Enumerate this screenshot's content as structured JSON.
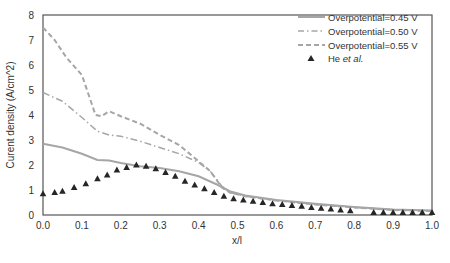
{
  "chart_data": {
    "type": "line",
    "title": "",
    "xlabel": "x/l",
    "ylabel": "Curent density (A/cm^2)",
    "xlim": [
      0.0,
      1.0
    ],
    "ylim": [
      0,
      8
    ],
    "xticks": [
      "0.0",
      "0.1",
      "0.2",
      "0.3",
      "0.4",
      "0.5",
      "0.6",
      "0.7",
      "0.8",
      "0.9",
      "1.0"
    ],
    "yticks": [
      "0",
      "1",
      "2",
      "3",
      "4",
      "5",
      "6",
      "7",
      "8"
    ],
    "grid": false,
    "legend_position": "upper right",
    "series": [
      {
        "name": "Overpotential=0.45 V",
        "style": "solid",
        "color": "#a6a6a6",
        "x": [
          0.0,
          0.05,
          0.1,
          0.14,
          0.17,
          0.2,
          0.25,
          0.3,
          0.35,
          0.4,
          0.45,
          0.48,
          0.52,
          0.6,
          0.7,
          0.8,
          0.9,
          1.0
        ],
        "y": [
          2.85,
          2.7,
          2.45,
          2.2,
          2.18,
          2.08,
          1.95,
          1.88,
          1.75,
          1.55,
          1.2,
          0.95,
          0.78,
          0.6,
          0.45,
          0.32,
          0.22,
          0.18
        ]
      },
      {
        "name": "Overpotential=0.50 V",
        "style": "dashdot",
        "color": "#a6a6a6",
        "x": [
          0.0,
          0.05,
          0.1,
          0.14,
          0.17,
          0.2,
          0.25,
          0.3,
          0.35,
          0.4,
          0.43,
          0.46,
          0.48,
          0.52,
          0.6,
          0.7,
          0.8,
          0.9,
          1.0
        ],
        "y": [
          4.9,
          4.55,
          3.9,
          3.35,
          3.2,
          3.15,
          2.95,
          2.7,
          2.45,
          2.1,
          1.75,
          1.15,
          0.9,
          0.75,
          0.58,
          0.42,
          0.3,
          0.2,
          0.16
        ]
      },
      {
        "name": "Overpotential=0.55 V",
        "style": "dashed",
        "color": "#a6a6a6",
        "x": [
          0.0,
          0.03,
          0.06,
          0.1,
          0.135,
          0.15,
          0.17,
          0.2,
          0.25,
          0.3,
          0.35,
          0.4,
          0.43,
          0.46,
          0.48,
          0.52,
          0.6,
          0.7,
          0.8,
          0.9,
          1.0
        ],
        "y": [
          7.5,
          7.0,
          6.3,
          5.6,
          4.0,
          3.95,
          4.15,
          3.95,
          3.65,
          3.2,
          2.8,
          2.15,
          1.75,
          1.1,
          0.9,
          0.75,
          0.58,
          0.42,
          0.3,
          0.2,
          0.16
        ]
      },
      {
        "name": "He et al.",
        "style": "marker-triangle",
        "color": "#262626",
        "x": [
          0.0,
          0.03,
          0.05,
          0.08,
          0.11,
          0.14,
          0.165,
          0.19,
          0.215,
          0.24,
          0.265,
          0.29,
          0.315,
          0.34,
          0.365,
          0.39,
          0.415,
          0.44,
          0.465,
          0.49,
          0.515,
          0.54,
          0.565,
          0.59,
          0.615,
          0.64,
          0.665,
          0.69,
          0.715,
          0.74,
          0.765,
          0.79,
          0.85,
          0.875,
          0.9,
          0.925,
          0.95,
          0.975,
          1.0
        ],
        "y": [
          0.85,
          0.9,
          0.95,
          1.1,
          1.25,
          1.45,
          1.6,
          1.8,
          1.9,
          2.0,
          1.95,
          1.85,
          1.7,
          1.55,
          1.35,
          1.2,
          1.05,
          0.9,
          0.75,
          0.65,
          0.6,
          0.55,
          0.5,
          0.45,
          0.42,
          0.38,
          0.35,
          0.3,
          0.27,
          0.24,
          0.2,
          0.17,
          0.1,
          0.1,
          0.1,
          0.1,
          0.1,
          0.1,
          0.1
        ]
      }
    ]
  },
  "legend": {
    "items": [
      {
        "label": "Overpotential=0.45 V"
      },
      {
        "label": "Overpotential=0.50 V"
      },
      {
        "label": "Overpotential=0.55 V"
      },
      {
        "label_prefix": "He ",
        "label_italic": "et al."
      }
    ]
  }
}
